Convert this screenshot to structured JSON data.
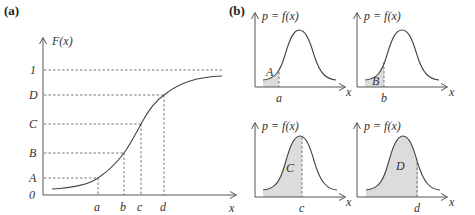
{
  "panels": {
    "a": {
      "label": "(a)",
      "y_axis_label": "F(x)",
      "x_axis_label": "x",
      "y_levels": [
        {
          "label": "1",
          "y": 70
        },
        {
          "label": "D",
          "y": 95
        },
        {
          "label": "C",
          "y": 124
        },
        {
          "label": "B",
          "y": 153
        },
        {
          "label": "A",
          "y": 178
        },
        {
          "label": "0",
          "y": 195
        }
      ],
      "x_points": [
        {
          "label": "a",
          "x": 98
        },
        {
          "label": "b",
          "x": 124
        },
        {
          "label": "c",
          "x": 141
        },
        {
          "label": "d",
          "x": 164
        }
      ]
    },
    "b": {
      "label": "(b)",
      "subplots": [
        {
          "y_axis_label": "p = f(x)",
          "x_axis_label": "x",
          "point_label": "a",
          "area_label": "A"
        },
        {
          "y_axis_label": "p = f(x)",
          "x_axis_label": "x",
          "point_label": "b",
          "area_label": "B"
        },
        {
          "y_axis_label": "p = f(x)",
          "x_axis_label": "x",
          "point_label": "c",
          "area_label": "C"
        },
        {
          "y_axis_label": "p = f(x)",
          "x_axis_label": "x",
          "point_label": "d",
          "area_label": "D"
        }
      ]
    }
  },
  "colors": {
    "line": "#444444",
    "shade": "#dcdcdc"
  }
}
